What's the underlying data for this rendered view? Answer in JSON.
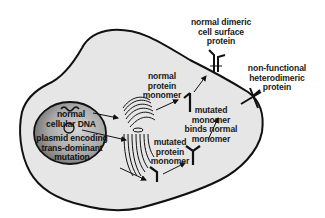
{
  "diagram": {
    "type": "cell-biology-schematic",
    "colors": {
      "background": "#ffffff",
      "cytoplasm": "#e8e8e8",
      "nucleus_light": "#bdbdbd",
      "nucleus_dark": "#6e6e6e",
      "outline": "#111111"
    },
    "nucleus": {
      "normal_dna_label": "normal\ncellular DNA",
      "plasmid_label": "plasmid encoding\ntrans-dominant\nmutation"
    },
    "organelle": "golgi-er",
    "labels": {
      "normal_protein_monomer": "normal\nprotein\nmonomer",
      "mutated_protein_monomer": "mutated\nprotein\nmonomer",
      "mutated_binds_normal": "mutated\nmonomer\nbinds normal\nmonomer",
      "normal_dimeric": "normal dimeric\ncell surface\nprotein",
      "non_functional": "non-functional\nheterodimeric\nprotein"
    }
  }
}
